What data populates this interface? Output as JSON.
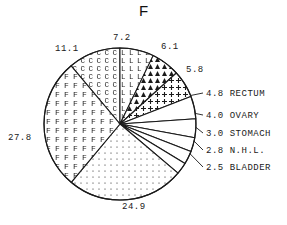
{
  "chart_data": {
    "type": "pie",
    "title": "F",
    "xlabel": "",
    "ylabel": "",
    "legend_position": "right",
    "grid": false,
    "units": "percent",
    "total": 100.0,
    "categories": [
      "11.1",
      "7.2",
      "6.1",
      "5.8",
      "RECTUM",
      "OVARY",
      "STOMACH",
      "N.H.L.",
      "BLADDER",
      "24.9",
      "27.8"
    ],
    "values": [
      11.1,
      7.2,
      6.1,
      5.8,
      4.8,
      4.0,
      3.0,
      2.8,
      2.5,
      24.9,
      27.8
    ],
    "slices": [
      {
        "value": 11.1,
        "label": "11.1",
        "name": "",
        "pattern": "letter-c",
        "fill_char": "C"
      },
      {
        "value": 7.2,
        "label": "7.2",
        "name": "",
        "pattern": "letter-l",
        "fill_char": "L"
      },
      {
        "value": 6.1,
        "label": "6.1",
        "name": "",
        "pattern": "triangles",
        "fill_char": "A"
      },
      {
        "value": 5.8,
        "label": "5.8",
        "name": "",
        "pattern": "plus",
        "fill_char": "+"
      },
      {
        "value": 4.8,
        "label": "4.8",
        "name": "RECTUM",
        "pattern": "blank",
        "fill_char": ""
      },
      {
        "value": 4.0,
        "label": "4.0",
        "name": "OVARY",
        "pattern": "blank",
        "fill_char": ""
      },
      {
        "value": 3.0,
        "label": "3.0",
        "name": "STOMACH",
        "pattern": "blank",
        "fill_char": ""
      },
      {
        "value": 2.8,
        "label": "2.8",
        "name": "N.H.L.",
        "pattern": "blank",
        "fill_char": ""
      },
      {
        "value": 2.5,
        "label": "2.5",
        "name": "BLADDER",
        "pattern": "blank",
        "fill_char": ""
      },
      {
        "value": 24.9,
        "label": "24.9",
        "name": "",
        "pattern": "dots",
        "fill_char": "."
      },
      {
        "value": 27.8,
        "label": "27.8",
        "name": "",
        "pattern": "letter-f",
        "fill_char": "F"
      }
    ]
  },
  "labels": {
    "top_left": "11.1",
    "top_center": "7.2",
    "top_right": "6.1",
    "right_upper": "5.8",
    "left": "27.8",
    "bottom": "24.9"
  },
  "legend": {
    "rows": [
      {
        "value": "4.8",
        "name": "RECTUM"
      },
      {
        "value": "4.0",
        "name": "OVARY"
      },
      {
        "value": "3.0",
        "name": "STOMACH"
      },
      {
        "value": "2.8",
        "name": "N.H.L."
      },
      {
        "value": "2.5",
        "name": "BLADDER"
      }
    ]
  },
  "colors": {
    "stroke": "#1a1a1a",
    "background": "#ffffff",
    "text": "#1a1a1a"
  }
}
